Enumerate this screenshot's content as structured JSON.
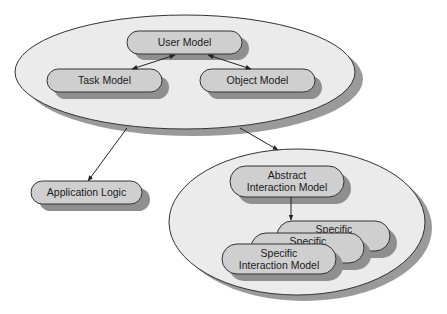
{
  "colors": {
    "background": "#ffffff",
    "ellipse_fill": "#ebebeb",
    "ellipse_shadow": "#9a9a9a",
    "node_fill": "#cfcfcf",
    "node_shadow": "#8f8f8f",
    "stroke": "#333333"
  },
  "groups": {
    "user_context": {
      "nodes": {
        "user_model": "User Model",
        "task_model": "Task Model",
        "object_model": "Object Model"
      }
    },
    "interaction": {
      "nodes": {
        "abstract_line1": "Abstract",
        "abstract_line2": "Interaction Model",
        "specific_back": "Specific",
        "specific_mid": "Specific",
        "specific_front_line1": "Specific",
        "specific_front_line2": "Interaction Model"
      }
    }
  },
  "standalone": {
    "application_logic": "Application Logic"
  },
  "edges": [
    {
      "from": "user_model",
      "to": "task_model",
      "type": "bidirectional"
    },
    {
      "from": "user_model",
      "to": "object_model",
      "type": "bidirectional"
    },
    {
      "from": "user_context",
      "to": "application_logic",
      "type": "directed"
    },
    {
      "from": "user_context",
      "to": "interaction",
      "type": "directed"
    },
    {
      "from": "abstract_interaction_model",
      "to": "specific_interaction_model",
      "type": "directed"
    }
  ]
}
